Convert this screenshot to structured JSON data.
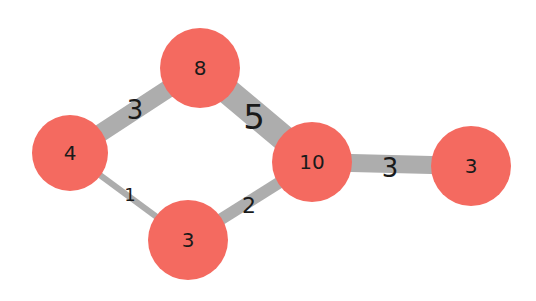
{
  "graph": {
    "node_color": "#F46A60",
    "edge_color": "#ADADAD",
    "nodes": [
      {
        "id": "n8",
        "label": "8",
        "x": 200,
        "y": 68,
        "r": 40
      },
      {
        "id": "n4",
        "label": "4",
        "x": 70,
        "y": 153,
        "r": 38
      },
      {
        "id": "n10",
        "label": "10",
        "x": 312,
        "y": 162,
        "r": 40
      },
      {
        "id": "n3r",
        "label": "3",
        "x": 471,
        "y": 166,
        "r": 40
      },
      {
        "id": "n3b",
        "label": "3",
        "x": 188,
        "y": 240,
        "r": 40
      }
    ],
    "edges": [
      {
        "id": "e4_8",
        "source": "n4",
        "target": "n8",
        "weight": 3,
        "label": "3",
        "width": 18,
        "lx": 135,
        "ly": 110,
        "fs": 26
      },
      {
        "id": "e8_10",
        "source": "n8",
        "target": "n10",
        "weight": 5,
        "label": "5",
        "width": 26,
        "lx": 254,
        "ly": 117,
        "fs": 34
      },
      {
        "id": "e4_3b",
        "source": "n4",
        "target": "n3b",
        "weight": 1,
        "label": "1",
        "width": 6,
        "lx": 130,
        "ly": 194,
        "fs": 18
      },
      {
        "id": "e3b_10",
        "source": "n3b",
        "target": "n10",
        "weight": 2,
        "label": "2",
        "width": 12,
        "lx": 249,
        "ly": 205,
        "fs": 22
      },
      {
        "id": "e10_3r",
        "source": "n10",
        "target": "n3r",
        "weight": 3,
        "label": "3",
        "width": 18,
        "lx": 390,
        "ly": 168,
        "fs": 26
      }
    ]
  }
}
